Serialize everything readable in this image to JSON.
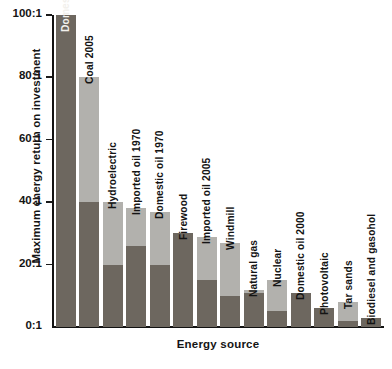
{
  "chart_data": {
    "type": "bar",
    "title": "",
    "xlabel": "Energy source",
    "ylabel": "Maximum energy return on investment",
    "ylim": [
      0,
      100
    ],
    "yticks": [
      "0:1",
      "20:1",
      "40:1",
      "60:1",
      "80:1",
      "100:1"
    ],
    "ytick_values": [
      0,
      20,
      40,
      60,
      80,
      100
    ],
    "grid": false,
    "legend": "none",
    "units": "energy return on investment ratio (EROI)",
    "categories": [
      "Domestic oil 1930",
      "Coal 2005",
      "Hydroelectric",
      "Imported oil 1970",
      "Domestic oil 1970",
      "Firewood",
      "Imported oil 2005",
      "Windmill",
      "Natural gas",
      "Nuclear",
      "Domestic oil 2000",
      "Photovoltaic",
      "Tar sands",
      "Biodiesel and gasohol"
    ],
    "values": [
      100,
      80,
      40,
      38,
      37,
      30,
      29,
      27,
      12,
      15,
      11,
      6,
      8,
      3
    ],
    "series": [
      {
        "name": "lower estimate (dark)",
        "values": [
          100,
          40,
          20,
          26,
          20,
          30,
          15,
          10,
          11,
          5,
          11,
          6,
          2,
          3
        ]
      },
      {
        "name": "upper range (light)",
        "values": [
          0,
          40,
          20,
          12,
          17,
          0,
          14,
          17,
          1,
          10,
          0,
          0,
          6,
          0
        ]
      }
    ],
    "colors": {
      "dark": "#6d675f",
      "light": "#b2b1ad",
      "axis": "#121212",
      "text": "#141414",
      "label_on_dark": "#f2f0ec",
      "background": "#ffffff"
    },
    "label_placement": [
      "inside",
      "outside",
      "outside",
      "outside",
      "outside",
      "outside",
      "outside",
      "outside",
      "outside",
      "outside",
      "outside",
      "outside",
      "outside",
      "outside"
    ]
  }
}
